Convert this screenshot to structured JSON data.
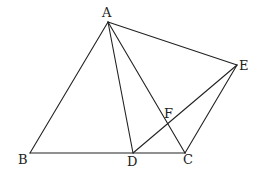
{
  "diagram": {
    "type": "geometry",
    "stroke_color": "#222222",
    "background": "#ffffff",
    "points": {
      "A": {
        "label": "A",
        "x": 108,
        "y": 22,
        "lx": 102,
        "ly": 17
      },
      "B": {
        "label": "B",
        "x": 30,
        "y": 153,
        "lx": 18,
        "ly": 164
      },
      "C": {
        "label": "C",
        "x": 185,
        "y": 153,
        "lx": 183,
        "ly": 164
      },
      "D": {
        "label": "D",
        "x": 133,
        "y": 153,
        "lx": 127,
        "ly": 166
      },
      "E": {
        "label": "E",
        "x": 237,
        "y": 65,
        "lx": 239,
        "ly": 70
      },
      "F": {
        "label": "F",
        "x": 167,
        "y": 122,
        "lx": 164,
        "ly": 118
      }
    },
    "segments": [
      [
        "A",
        "B"
      ],
      [
        "B",
        "C"
      ],
      [
        "A",
        "C"
      ],
      [
        "A",
        "D"
      ],
      [
        "A",
        "E"
      ],
      [
        "E",
        "C"
      ],
      [
        "D",
        "E"
      ]
    ]
  }
}
